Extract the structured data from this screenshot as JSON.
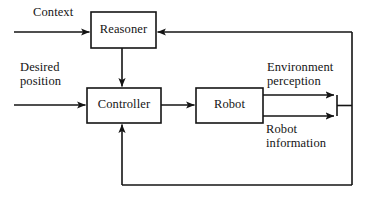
{
  "diagram": {
    "stroke_color": "#141414",
    "background_color": "#ffffff",
    "nodes": [
      {
        "id": "reasoner",
        "label": "Reasoner",
        "x": 91,
        "y": 12,
        "w": 65,
        "h": 36
      },
      {
        "id": "controller",
        "label": "Controller",
        "x": 87,
        "y": 88,
        "w": 74,
        "h": 35
      },
      {
        "id": "robot",
        "label": "Robot",
        "x": 196,
        "y": 88,
        "w": 67,
        "h": 35
      }
    ],
    "edge_labels": {
      "context": "Context",
      "desired_line1": "Desired",
      "desired_line2": "position",
      "environment_line1": "Environment",
      "environment_line2": "perception",
      "robot_info_line1": "Robot",
      "robot_info_line2": "information"
    },
    "edges": [
      {
        "id": "context-to-reasoner",
        "from": "input",
        "to": "reasoner",
        "arrow": "right"
      },
      {
        "id": "desired-to-controller",
        "from": "input",
        "to": "controller",
        "arrow": "right"
      },
      {
        "id": "reasoner-to-controller",
        "from": "reasoner",
        "to": "controller",
        "arrow": "down"
      },
      {
        "id": "controller-to-robot",
        "from": "controller",
        "to": "robot",
        "arrow": "right"
      },
      {
        "id": "robot-to-environment",
        "from": "robot",
        "to": "bus",
        "arrow": "right"
      },
      {
        "id": "robot-to-information",
        "from": "robot",
        "to": "bus",
        "arrow": "right"
      },
      {
        "id": "bus-to-reasoner",
        "from": "bus",
        "to": "reasoner",
        "arrow": "left"
      },
      {
        "id": "bus-to-controller",
        "from": "bus",
        "to": "controller",
        "arrow": "up"
      }
    ]
  }
}
